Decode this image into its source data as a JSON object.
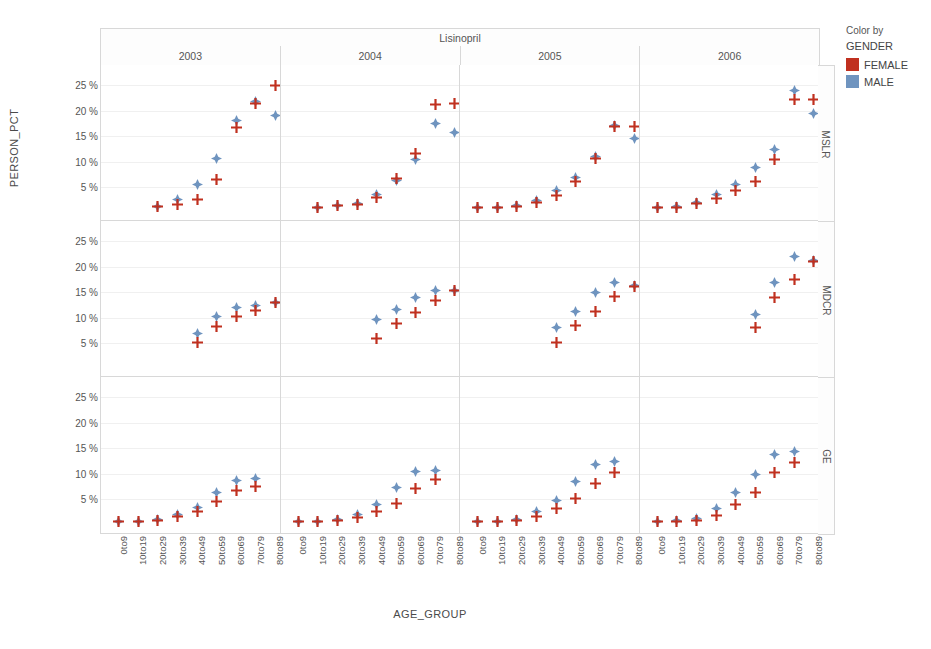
{
  "chart_data": {
    "type": "scatter",
    "title": "Lisinopril",
    "xlabel": "AGE_GROUP",
    "ylabel": "PERSON_PCT",
    "grid": true,
    "legend": {
      "position": "right",
      "title": "Color by",
      "variable": "GENDER",
      "entries": [
        {
          "name": "FEMALE",
          "color": "#c0301f",
          "marker": "plus"
        },
        {
          "name": "MALE",
          "color": "#6f94bf",
          "marker": "diamond"
        }
      ]
    },
    "columns": [
      "2003",
      "2004",
      "2005",
      "2006"
    ],
    "rows": [
      "MSLR",
      "MDCR",
      "GE"
    ],
    "categories": [
      "0to9",
      "10to19",
      "20to29",
      "30to39",
      "40to49",
      "50to59",
      "60to69",
      "70to79",
      "80to89"
    ],
    "yticks": [
      "5 %",
      "10 %",
      "15 %",
      "20 %",
      "25 %"
    ],
    "ytickvals": [
      5,
      10,
      15,
      20,
      25
    ],
    "ylim": [
      0,
      27
    ],
    "panels": [
      {
        "row": "MSLR",
        "column": "2003",
        "series": [
          {
            "name": "FEMALE",
            "values": [
              null,
              null,
              1.2,
              1.6,
              2.6,
              6.5,
              16.8,
              21.5,
              24.9
            ]
          },
          {
            "name": "MALE",
            "values": [
              null,
              null,
              1.3,
              2.6,
              5.5,
              10.6,
              18.1,
              21.9,
              19.0
            ]
          }
        ]
      },
      {
        "row": "MSLR",
        "column": "2004",
        "series": [
          {
            "name": "FEMALE",
            "values": [
              null,
              1.0,
              1.4,
              1.6,
              3.0,
              6.7,
              11.6,
              21.3,
              21.4
            ]
          },
          {
            "name": "MALE",
            "values": [
              null,
              1.0,
              1.4,
              1.8,
              3.6,
              6.4,
              10.4,
              17.5,
              15.8
            ]
          }
        ]
      },
      {
        "row": "MSLR",
        "column": "2005",
        "series": [
          {
            "name": "FEMALE",
            "values": [
              1.0,
              1.0,
              1.3,
              2.0,
              3.4,
              6.2,
              10.6,
              17.0,
              17.0
            ]
          },
          {
            "name": "MALE",
            "values": [
              1.0,
              1.0,
              1.4,
              2.5,
              4.5,
              7.0,
              11.1,
              17.2,
              14.6
            ]
          }
        ]
      },
      {
        "row": "MSLR",
        "column": "2006",
        "series": [
          {
            "name": "FEMALE",
            "values": [
              1.0,
              1.1,
              1.8,
              2.9,
              4.5,
              6.1,
              10.4,
              22.3,
              22.3
            ]
          },
          {
            "name": "MALE",
            "values": [
              1.0,
              1.2,
              2.1,
              3.6,
              5.5,
              9.0,
              12.4,
              24.0,
              19.5
            ]
          }
        ]
      },
      {
        "row": "MDCR",
        "column": "2003",
        "series": [
          {
            "name": "FEMALE",
            "values": [
              null,
              null,
              null,
              null,
              5.1,
              8.4,
              10.2,
              11.4,
              13.0
            ]
          },
          {
            "name": "MALE",
            "values": [
              null,
              null,
              null,
              null,
              7.0,
              10.3,
              12.0,
              12.5,
              13.0
            ]
          }
        ]
      },
      {
        "row": "MDCR",
        "column": "2004",
        "series": [
          {
            "name": "FEMALE",
            "values": [
              null,
              null,
              null,
              null,
              6.0,
              9.0,
              11.0,
              13.5,
              15.3
            ]
          },
          {
            "name": "MALE",
            "values": [
              null,
              null,
              null,
              null,
              9.7,
              11.7,
              14.0,
              15.3,
              15.4
            ]
          }
        ]
      },
      {
        "row": "MDCR",
        "column": "2005",
        "series": [
          {
            "name": "FEMALE",
            "values": [
              null,
              null,
              null,
              null,
              5.2,
              8.6,
              11.3,
              14.2,
              16.2
            ]
          },
          {
            "name": "MALE",
            "values": [
              null,
              null,
              null,
              null,
              8.2,
              11.3,
              15.0,
              17.0,
              16.3
            ]
          }
        ]
      },
      {
        "row": "MDCR",
        "column": "2006",
        "series": [
          {
            "name": "FEMALE",
            "values": [
              null,
              null,
              null,
              null,
              null,
              8.1,
              14.0,
              17.5,
              21.1
            ]
          },
          {
            "name": "MALE",
            "values": [
              null,
              null,
              null,
              null,
              null,
              10.7,
              17.0,
              22.1,
              21.3
            ]
          }
        ]
      },
      {
        "row": "GE",
        "column": "2003",
        "series": [
          {
            "name": "FEMALE",
            "values": [
              0.7,
              0.7,
              0.9,
              1.7,
              2.7,
              4.6,
              6.7,
              7.6,
              null
            ]
          },
          {
            "name": "MALE",
            "values": [
              0.7,
              0.7,
              1.0,
              2.1,
              3.5,
              6.3,
              8.8,
              9.1,
              null
            ]
          }
        ]
      },
      {
        "row": "GE",
        "column": "2004",
        "series": [
          {
            "name": "FEMALE",
            "values": [
              0.7,
              0.7,
              0.8,
              1.4,
              2.6,
              4.3,
              7.1,
              9.0,
              null
            ]
          },
          {
            "name": "MALE",
            "values": [
              0.7,
              0.7,
              1.0,
              2.0,
              4.1,
              7.4,
              10.4,
              10.7,
              null
            ]
          }
        ]
      },
      {
        "row": "GE",
        "column": "2005",
        "series": [
          {
            "name": "FEMALE",
            "values": [
              0.7,
              0.7,
              0.9,
              1.6,
              3.2,
              5.1,
              8.1,
              10.2,
              null
            ]
          },
          {
            "name": "MALE",
            "values": [
              0.7,
              0.7,
              1.1,
              2.6,
              4.7,
              8.5,
              11.8,
              12.5,
              null
            ]
          }
        ]
      },
      {
        "row": "GE",
        "column": "2006",
        "series": [
          {
            "name": "FEMALE",
            "values": [
              0.7,
              0.7,
              0.9,
              1.9,
              4.1,
              6.3,
              10.3,
              12.3,
              null
            ]
          },
          {
            "name": "MALE",
            "values": [
              0.7,
              0.8,
              1.2,
              3.2,
              6.4,
              9.8,
              13.7,
              14.3,
              null
            ]
          }
        ]
      }
    ]
  }
}
